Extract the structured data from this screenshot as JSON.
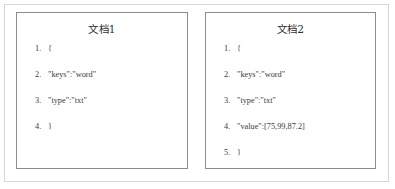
{
  "figure": {
    "border_color": "#d6d6d6",
    "card_border_color": "#8d8d8d",
    "background": "#ffffff",
    "text_color": "#3a3a3a"
  },
  "cards": [
    {
      "id": "document-1",
      "title": "文档1",
      "items": [
        {
          "marker": "1.",
          "text": "{"
        },
        {
          "marker": "2.",
          "text": "\"keys\":\"word\""
        },
        {
          "marker": "3.",
          "text": "\"type\":\"txt\""
        },
        {
          "marker": "4.",
          "text": "}"
        }
      ]
    },
    {
      "id": "document-2",
      "title": "文档2",
      "items": [
        {
          "marker": "1.",
          "text": "{"
        },
        {
          "marker": "2.",
          "text": "\"keys\":\"word\""
        },
        {
          "marker": "3.",
          "text": "\"type\":\"txt\""
        },
        {
          "marker": "4.",
          "text": "\"value\":[75,99,87.2]"
        },
        {
          "marker": "5.",
          "text": "}"
        }
      ]
    }
  ]
}
